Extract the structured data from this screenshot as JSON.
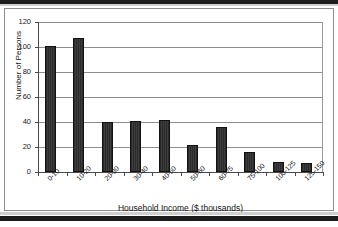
{
  "chart_data": {
    "type": "bar",
    "title": "",
    "subtitle": "",
    "xlabel": "Household Income ($ thousands)",
    "ylabel": "Number of Persons",
    "categories": [
      "0-10",
      "10-20",
      "20-30",
      "30-40",
      "40-50",
      "50-60",
      "60-75",
      "75-100",
      "100-125",
      "125-150"
    ],
    "values": [
      101,
      107,
      40,
      41,
      42,
      22,
      36,
      16,
      8,
      7
    ],
    "ylim": [
      0,
      120
    ],
    "ytick_labels": [
      "0",
      "20",
      "40",
      "60",
      "80",
      "100",
      "120"
    ],
    "ytick_values": [
      0,
      20,
      40,
      60,
      80,
      100,
      120
    ],
    "grid": "horizontal",
    "legend": "none",
    "bar_color": "#2b2b2b",
    "gridline_color": "#8d8d8d",
    "axis_color": "#4a4a4a",
    "background_color": "#ffffff",
    "annotations": []
  },
  "frame": {
    "border_color": "#8e8e8e",
    "scan_bar_color": "#1c1c1c"
  }
}
